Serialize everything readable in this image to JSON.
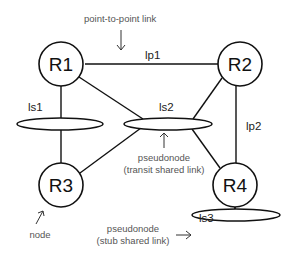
{
  "diagram": {
    "nodes": [
      {
        "id": "R1",
        "label": "R1"
      },
      {
        "id": "R2",
        "label": "R2"
      },
      {
        "id": "R3",
        "label": "R3"
      },
      {
        "id": "R4",
        "label": "R4"
      }
    ],
    "pseudonodes": [
      {
        "id": "ls1",
        "label": "ls1"
      },
      {
        "id": "ls2",
        "label": "ls2"
      },
      {
        "id": "ls3",
        "label": "ls3"
      }
    ],
    "links": [
      {
        "from": "R1",
        "to": "R2",
        "label": "lp1"
      },
      {
        "from": "R2",
        "to": "R4",
        "label": "lp2"
      },
      {
        "from": "R1",
        "to": "ls1"
      },
      {
        "from": "ls1",
        "to": "R3"
      },
      {
        "from": "R1",
        "to": "ls2"
      },
      {
        "from": "R2",
        "to": "ls2"
      },
      {
        "from": "R3",
        "to": "ls2"
      },
      {
        "from": "R4",
        "to": "ls2"
      },
      {
        "from": "R4",
        "to": "ls3"
      }
    ],
    "annotations": {
      "point_to_point": "point-to-point link",
      "transit_line1": "pseudonode",
      "transit_line2": "(transit shared link)",
      "stub_line1": "pseudonode",
      "stub_line2": "(stub shared link)",
      "node": "node"
    }
  }
}
